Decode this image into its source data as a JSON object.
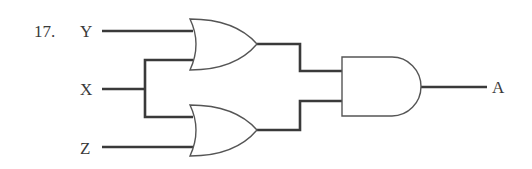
{
  "problem_number": "17.",
  "inputs": [
    {
      "label": "Y"
    },
    {
      "label": "X"
    },
    {
      "label": "Z"
    }
  ],
  "output": {
    "label": "A"
  },
  "gates": [
    {
      "id": "or-top",
      "type": "OR",
      "inputs": [
        "Y",
        "X"
      ]
    },
    {
      "id": "or-bottom",
      "type": "OR",
      "inputs": [
        "X",
        "Z"
      ]
    },
    {
      "id": "and-final",
      "type": "AND",
      "inputs": [
        "or-top",
        "or-bottom"
      ],
      "output": "A"
    }
  ],
  "colors": {
    "line": "#3a3a3a",
    "gate_outline": "#555555",
    "background": "#ffffff"
  }
}
